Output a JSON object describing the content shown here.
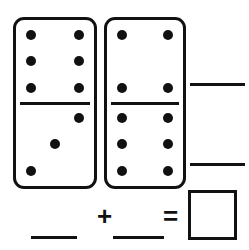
{
  "worksheet": {
    "title": "Domino Addition",
    "dominoes": [
      {
        "name": "domino-left",
        "top_pips": 6,
        "bottom_pips": 3,
        "top_layout": [
          1,
          0,
          1,
          1,
          0,
          1,
          1,
          0,
          1
        ],
        "bottom_layout": [
          0,
          0,
          1,
          0,
          1,
          0,
          1,
          0,
          0
        ]
      },
      {
        "name": "domino-right",
        "top_pips": 4,
        "bottom_pips": 6,
        "top_layout": [
          1,
          0,
          1,
          0,
          0,
          0,
          1,
          0,
          1
        ],
        "bottom_layout": [
          1,
          0,
          1,
          1,
          0,
          1,
          1,
          0,
          1
        ]
      }
    ],
    "right_blanks": [
      {
        "name": "blank-top-count",
        "value": ""
      },
      {
        "name": "blank-bottom-count",
        "value": ""
      }
    ],
    "equation": {
      "left_blank": "",
      "plus_symbol": "+",
      "right_blank": "",
      "equals_symbol": "=",
      "answer_box_value": ""
    },
    "colors": {
      "ink": "#111111",
      "paper": "#ffffff"
    }
  }
}
